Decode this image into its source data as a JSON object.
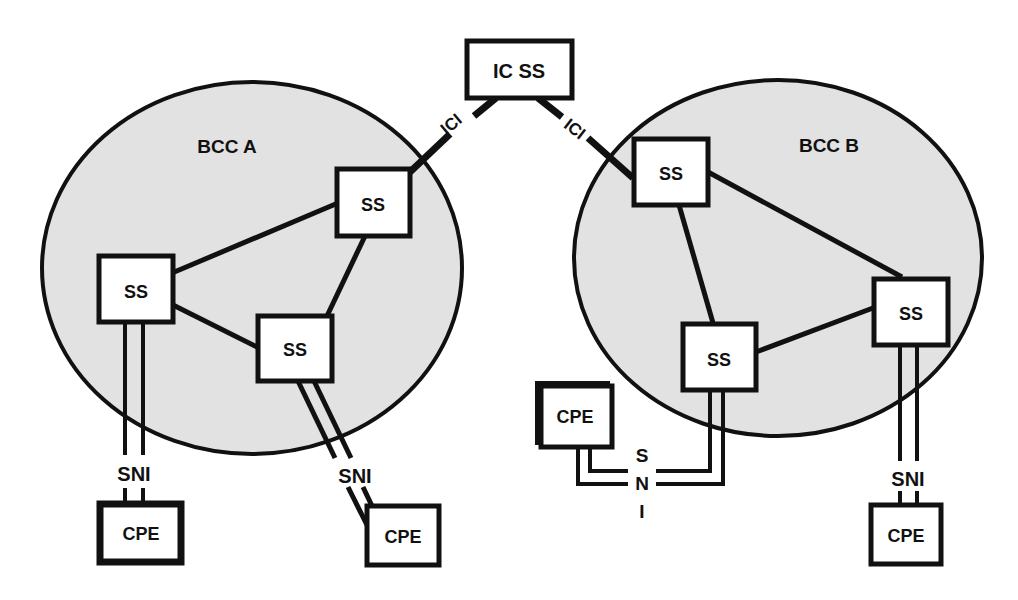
{
  "diagram": {
    "colors": {
      "line": "#111111",
      "cloud_fill": "#e2e2e2",
      "box_fill": "#ffffff",
      "background": "#ffffff"
    },
    "interconnect": {
      "label": "IC SS",
      "links": [
        {
          "label": "ICI",
          "to": "BCC A"
        },
        {
          "label": "ICI",
          "to": "BCC B"
        }
      ]
    },
    "clouds": [
      {
        "name": "BCC A",
        "switches": [
          "SS",
          "SS",
          "SS"
        ],
        "cpe": [
          {
            "label": "CPE",
            "interface": "SNI"
          },
          {
            "label": "CPE",
            "interface": "SNI"
          }
        ]
      },
      {
        "name": "BCC B",
        "switches": [
          "SS",
          "SS",
          "SS"
        ],
        "cpe": [
          {
            "label": "CPE",
            "interface_letters": [
              "S",
              "N",
              "I"
            ]
          },
          {
            "label": "CPE",
            "interface": "SNI"
          }
        ]
      }
    ]
  }
}
